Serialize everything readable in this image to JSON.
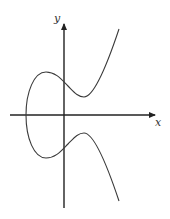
{
  "diagram": {
    "axes": {
      "x_label": "x",
      "y_label": "y"
    },
    "colors": {
      "curve": "#3a3a3a",
      "axes": "#222222",
      "background": "#ffffff"
    }
  }
}
